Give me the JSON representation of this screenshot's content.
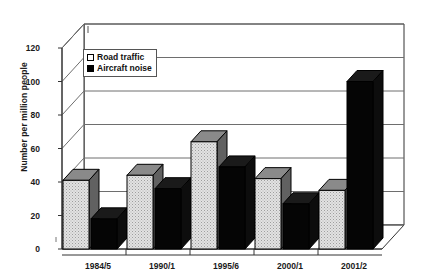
{
  "chart_data": {
    "type": "bar",
    "title": "",
    "subtitle": "",
    "xlabel": "",
    "ylabel": "Number per million people",
    "categories": [
      "1984/5",
      "1990/1",
      "1995/6",
      "2000/1",
      "2001/2"
    ],
    "series": [
      {
        "name": "Road traffic",
        "color": "#d9d9d9",
        "values": [
          41,
          44,
          64,
          42,
          35
        ]
      },
      {
        "name": "Aircraft noise",
        "color": "#000000",
        "values": [
          18,
          36,
          49,
          27,
          100
        ]
      }
    ],
    "ylim": [
      0,
      120
    ],
    "yticks": [
      0,
      20,
      40,
      60,
      80,
      100,
      120
    ],
    "ytick_labels": [
      "0",
      "20",
      "40",
      "60",
      "80",
      "100",
      "120"
    ],
    "grid": true,
    "grid_axis": "y",
    "legend_position": "upper-left-inside",
    "style": "3d-bar",
    "annotations": []
  },
  "legend": {
    "entries": [
      {
        "label": "Road traffic",
        "swatch": "open-square-icon"
      },
      {
        "label": "Aircraft noise",
        "swatch": "filled-square-icon"
      }
    ]
  },
  "axes": {
    "y_title": "Number per million people"
  }
}
